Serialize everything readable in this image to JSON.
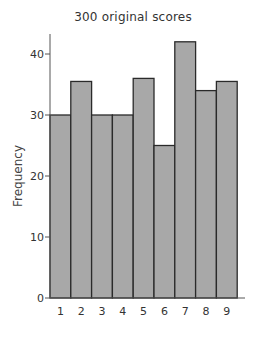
{
  "chart_data": {
    "type": "bar",
    "title": "300 original scores",
    "xlabel": "",
    "ylabel": "Frequency",
    "categories": [
      "1",
      "2",
      "3",
      "4",
      "5",
      "6",
      "7",
      "8",
      "9"
    ],
    "values": [
      30,
      35.5,
      30,
      30,
      36,
      25,
      42,
      34,
      35.5
    ],
    "yticks": [
      0,
      10,
      20,
      30,
      40
    ],
    "ylim": [
      0,
      44
    ],
    "grid": false,
    "legend": null,
    "bar_color": "#a8a8a8",
    "edge_color": "#2a2a2a"
  }
}
